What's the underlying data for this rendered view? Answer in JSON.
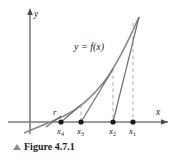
{
  "figure": {
    "caption": "Figure 4.7.1",
    "caption_marker": "triangle-up-icon"
  },
  "axes": {
    "x_label": "x",
    "y_label": "y",
    "x_axis_y": 122,
    "y_axis_x": 30,
    "x_axis_start": 8,
    "x_axis_end": 168,
    "y_axis_top": 10,
    "y_axis_bottom": 134,
    "axis_color": "#7a7a7a",
    "arrow_color": "#4d4d4d"
  },
  "curve": {
    "label": "y = f(x)",
    "label_x": 74,
    "label_y": 48,
    "color": "#8a8a8a",
    "path": "M 24,133 C 40,126 54,121 66,115 C 80,108 92,97 104,82 C 116,66 128,42 139,17"
  },
  "root": {
    "label": "r",
    "label_x": 53,
    "label_y": 115,
    "x": 57
  },
  "points": [
    {
      "name": "x1",
      "label": "x",
      "sub": "1",
      "x": 133,
      "y": 122,
      "curve_y": 23,
      "label_x": 131,
      "label_y": 133
    },
    {
      "name": "x2",
      "label": "x",
      "sub": "2",
      "x": 113,
      "y": 122,
      "curve_y": 69,
      "label_x": 111,
      "label_y": 133
    },
    {
      "name": "x3",
      "label": "x",
      "sub": "3",
      "x": 81,
      "y": 122,
      "curve_y": 105,
      "label_x": 79,
      "label_y": 133
    },
    {
      "name": "x4",
      "label": "x",
      "sub": "4",
      "x": 61,
      "y": 122,
      "curve_y": 116,
      "label_x": 59,
      "label_y": 133
    }
  ],
  "dashed_lines": [
    {
      "name": "dashed-x1",
      "x": 133,
      "y_top": 23,
      "y_bottom": 122
    },
    {
      "name": "dashed-x2",
      "x": 113,
      "y_top": 69,
      "y_bottom": 122
    },
    {
      "name": "dashed-x3",
      "x": 81,
      "y_top": 105,
      "y_bottom": 122
    }
  ],
  "tangent_lines": [
    {
      "name": "tangent-at-x1",
      "x1": 139,
      "y1": 17,
      "x2": 113,
      "y2": 122
    },
    {
      "name": "tangent-at-x2",
      "x1": 113,
      "y1": 69,
      "x2": 81,
      "y2": 122
    },
    {
      "name": "tangent-at-x3",
      "x1": 81,
      "y1": 105,
      "x2": 61,
      "y2": 122
    }
  ],
  "colors": {
    "dot": "#1a1a1a",
    "dashed": "#a9a9a9",
    "tangent": "#6f6f6f",
    "curve": "#8a8a8a",
    "text": "#1a1a1a"
  }
}
